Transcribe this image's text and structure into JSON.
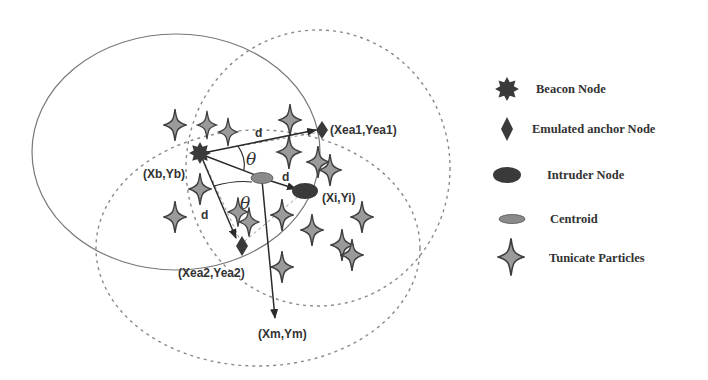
{
  "figure": {
    "labels": {
      "beacon": "(Xb,Yb)",
      "anchor1": "(Xea1,Yea1)",
      "anchor2": "(Xea2,Yea2)",
      "intruder": "(Xi,Yi)",
      "target": "(Xm,Ym)",
      "distance": "d",
      "angle": "θ"
    },
    "legend": [
      {
        "symbol": "beacon-node",
        "label": "Beacon Node"
      },
      {
        "symbol": "emulated-anchor-node",
        "label": "Emulated anchor Node"
      },
      {
        "symbol": "intruder-node",
        "label": "Intruder Node"
      },
      {
        "symbol": "centroid",
        "label": "Centroid"
      },
      {
        "symbol": "tunicate-particle",
        "label": "Tunicate Particles"
      }
    ],
    "colors": {
      "node_dark": "#3a3a3a",
      "centroid": "#8a8a8a",
      "particle_fill": "#9a9a9a",
      "particle_stroke": "#3e3e3e",
      "circle_solid": "#777777",
      "circle_dashed": "#8a8a8a",
      "arrow": "#2a2a2a"
    }
  }
}
